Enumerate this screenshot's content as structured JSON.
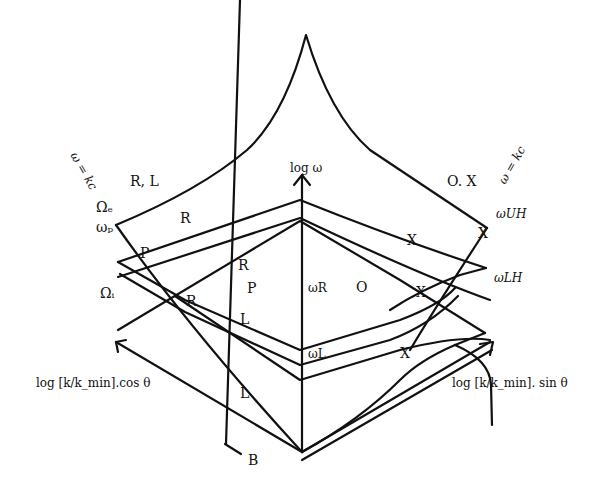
{
  "figure": {
    "type": "3D dispersion surface diagram for cold magnetized plasma",
    "axes": {
      "vertical": "log ω",
      "left": "log [k/k_min].cos θ",
      "right": "log [k/k_min]. sin θ",
      "field_direction": "B"
    },
    "left_edge_labels": {
      "light_line": "ω = kc",
      "omega_e": "Ωₑ",
      "omega_p": "ωₚ",
      "omega_i": "Ωᵢ"
    },
    "right_edge_labels": {
      "light_line": "ω = kc",
      "omega_uh": "ωUH",
      "omega_lh": "ωLH"
    },
    "axis_labels": {
      "omega_r": "ωR",
      "omega_l": "ωL"
    },
    "mode_labels": {
      "rl": "R, L",
      "ox": "O. X",
      "r1": "R",
      "r2": "R",
      "r3": "R",
      "p1": "P",
      "p2": "P",
      "l1": "L",
      "l2": "L",
      "o1": "O",
      "x1": "X",
      "x2": "X",
      "x3": "X",
      "x4": "X"
    }
  }
}
